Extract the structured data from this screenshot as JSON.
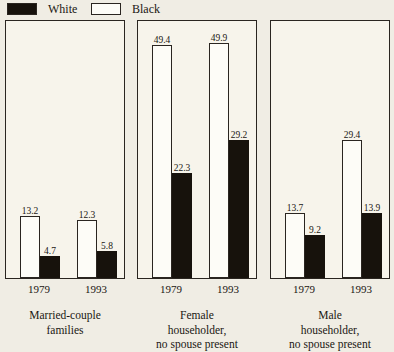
{
  "legend": {
    "entries": [
      {
        "label": "White",
        "swatch": "filled-black-box",
        "color": "#17120c"
      },
      {
        "label": "Black",
        "swatch": "hollow-white-box",
        "color": "#fdfcf7"
      }
    ]
  },
  "chart_data": {
    "type": "bar",
    "title": "",
    "xlabel": "",
    "ylabel": "",
    "grid": false,
    "legend_position": "top-left",
    "ylim": [
      0,
      55
    ],
    "axis_scale_px_per_unit": 4.71,
    "categories": [
      "1979",
      "1993"
    ],
    "legend_entries": [
      "White",
      "Black"
    ],
    "panels": [
      {
        "caption_lines": [
          "Married-couple",
          "families"
        ],
        "categories": [
          "1979",
          "1993"
        ],
        "series": [
          {
            "name": "White",
            "values": [
              13.2,
              12.3
            ],
            "swatch": "hollow"
          },
          {
            "name": "Black",
            "values": [
              4.7,
              5.8
            ],
            "swatch": "filled"
          }
        ]
      },
      {
        "caption_lines": [
          "Female",
          "householder,",
          "no spouse present"
        ],
        "categories": [
          "1979",
          "1993"
        ],
        "series": [
          {
            "name": "White",
            "values": [
              49.4,
              49.9
            ],
            "swatch": "hollow"
          },
          {
            "name": "Black",
            "values": [
              22.3,
              29.2
            ],
            "swatch": "filled"
          }
        ]
      },
      {
        "caption_lines": [
          "Male",
          "householder,",
          "no spouse present"
        ],
        "categories": [
          "1979",
          "1993"
        ],
        "series": [
          {
            "name": "White",
            "values": [
              13.7,
              29.4
            ],
            "swatch": "hollow"
          },
          {
            "name": "Black",
            "values": [
              9.2,
              13.9
            ],
            "swatch": "filled"
          }
        ]
      }
    ]
  }
}
